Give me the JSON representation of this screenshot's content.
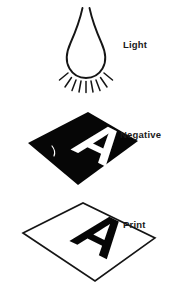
{
  "diagram": {
    "canvas": {
      "width": 170,
      "height": 282,
      "background": "#ffffff"
    },
    "ink_color": "#151515",
    "plate_black": "#060606",
    "paper_white": "#ffffff",
    "stages": [
      {
        "id": "light",
        "label": "Light",
        "label_x": 123,
        "label_y": 48,
        "icon": "light-bulb-with-rays",
        "ray_count": 9,
        "description": "Light source bulb emitting downward rays"
      },
      {
        "id": "negative",
        "label": "Negative",
        "label_x": 120,
        "label_y": 138,
        "icon": "black-film-plate-with-white-letter",
        "letter": "A",
        "letter_color": "#ffffff",
        "plate_color": "#060606",
        "description": "Black negative film with transparent letter A"
      },
      {
        "id": "print",
        "label": "Print",
        "label_x": 123,
        "label_y": 228,
        "icon": "white-paper-plate-with-black-letter",
        "letter": "A",
        "letter_color": "#060606",
        "plate_color": "#ffffff",
        "description": "White print paper with exposed black letter A"
      }
    ]
  }
}
